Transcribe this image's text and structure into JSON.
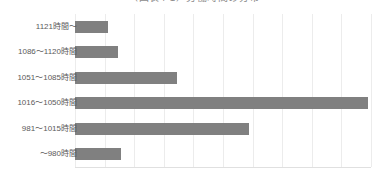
{
  "chart_data": {
    "type": "bar",
    "orientation": "horizontal",
    "title": "（図表4-1）労働時間の分布",
    "xlabel": "",
    "ylabel": "",
    "categories": [
      "1121時間〜",
      "1086〜1120時間",
      "1051〜1085時間",
      "1016〜1050時間",
      "981〜1015時間",
      "〜980時間"
    ],
    "values": [
      1.0,
      1.3,
      3.1,
      8.9,
      5.3,
      1.4
    ],
    "xlim": [
      0,
      9.0
    ],
    "grid": true,
    "gridline_count": 10,
    "legend": "none",
    "bar_color": "#808080",
    "gridline_color": "#ececec",
    "axis_color": "#e0e0e0",
    "label_color": "#5a5a5a",
    "title_color": "#8c8c8c",
    "background": "#ffffff",
    "tick_labels_x": [],
    "annotations": []
  }
}
